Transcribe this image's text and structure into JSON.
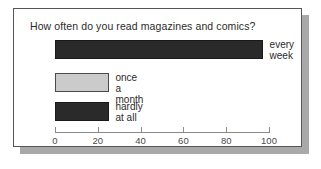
{
  "chart_data": {
    "type": "bar",
    "orientation": "horizontal",
    "title": "How often do you read magazines and comics?",
    "categories": [
      "every\nweek",
      "once a month",
      "hardly at all"
    ],
    "values": [
      97,
      25,
      25
    ],
    "series": [
      {
        "name": "percent",
        "values": [
          97,
          25,
          25
        ]
      }
    ],
    "xlabel": "",
    "ylabel": "",
    "xlim": [
      0,
      100
    ],
    "ticks": [
      "0",
      "20",
      "40",
      "60",
      "80",
      "100"
    ],
    "tick_values": [
      0,
      20,
      40,
      60,
      80,
      100
    ],
    "grid": false,
    "legend": "none",
    "bar_colors": [
      "#2a2a2a",
      "#cbcbcb",
      "#2a2a2a"
    ],
    "bar_border_colors": [
      "#1a1a1a",
      "#4a4a4a",
      "#1a1a1a"
    ],
    "bars": [
      {
        "label": "every\nweek",
        "value": 97,
        "style": "dark",
        "label_outside": true
      },
      {
        "label": "once a month",
        "value": 25,
        "style": "light",
        "label_outside": true
      },
      {
        "label": "hardly at all",
        "value": 25,
        "style": "dark",
        "label_outside": true
      }
    ]
  },
  "colors": {
    "frame_border": "#55565a",
    "shadow": "#a9a9a9",
    "axis": "#8a8a8a",
    "text": "#2b2b2b",
    "tick_text": "#4b4b4b",
    "background": "#ffffff"
  }
}
